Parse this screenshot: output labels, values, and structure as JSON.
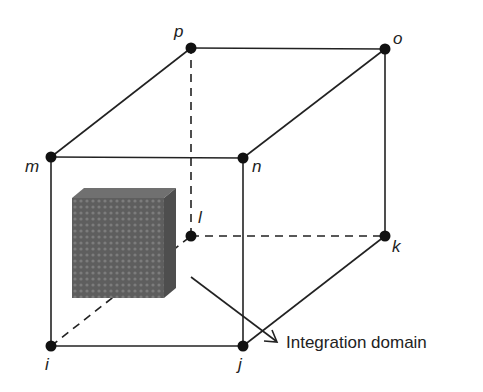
{
  "diagram": {
    "type": "cube-element-with-integration-domain",
    "colors": {
      "line": "#222222",
      "node": "#111111",
      "domain_fill": "#5a5a5a",
      "domain_texture": "#7a7a7a"
    },
    "nodes": [
      {
        "id": "i",
        "label": "i",
        "x": 51,
        "y": 346
      },
      {
        "id": "j",
        "label": "j",
        "x": 243,
        "y": 346
      },
      {
        "id": "k",
        "label": "k",
        "x": 385,
        "y": 236
      },
      {
        "id": "l",
        "label": "l",
        "x": 191,
        "y": 236
      },
      {
        "id": "m",
        "label": "m",
        "x": 51,
        "y": 157
      },
      {
        "id": "n",
        "label": "n",
        "x": 243,
        "y": 158
      },
      {
        "id": "o",
        "label": "o",
        "x": 385,
        "y": 49
      },
      {
        "id": "p",
        "label": "p",
        "x": 191,
        "y": 48
      }
    ],
    "edges_solid": [
      [
        "i",
        "j"
      ],
      [
        "j",
        "k"
      ],
      [
        "k",
        "o"
      ],
      [
        "o",
        "p"
      ],
      [
        "p",
        "m"
      ],
      [
        "m",
        "n"
      ],
      [
        "n",
        "o"
      ],
      [
        "m",
        "i"
      ],
      [
        "n",
        "j"
      ]
    ],
    "edges_dashed": [
      [
        "i",
        "l"
      ],
      [
        "l",
        "k"
      ],
      [
        "l",
        "p"
      ]
    ],
    "annotation": {
      "text": "Integration domain"
    }
  }
}
